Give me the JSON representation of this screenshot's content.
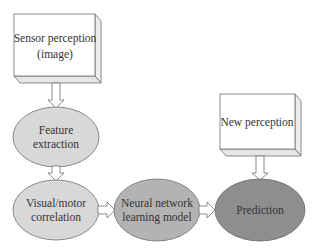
{
  "diagram": {
    "nodes": {
      "sensor": {
        "line1": "Sensor perception",
        "line2": "(image)",
        "shape": "3d-box"
      },
      "feature": {
        "line1": "Feature",
        "line2": "extraction",
        "shape": "ellipse",
        "fill": "#d8d8d8"
      },
      "visual": {
        "line1": "Visual/motor",
        "line2": "correlation",
        "shape": "ellipse",
        "fill": "#d8d8d8"
      },
      "neural": {
        "line1": "Neural network",
        "line2": "learning model",
        "shape": "ellipse",
        "fill": "#b3b3b3"
      },
      "prediction": {
        "line1": "Prediction",
        "shape": "ellipse",
        "fill": "#8e8e8e"
      },
      "newperception": {
        "line1": "New perception",
        "shape": "3d-box"
      }
    },
    "edges": [
      {
        "from": "sensor",
        "to": "feature"
      },
      {
        "from": "feature",
        "to": "visual"
      },
      {
        "from": "visual",
        "to": "neural"
      },
      {
        "from": "neural",
        "to": "prediction"
      },
      {
        "from": "newperception",
        "to": "prediction"
      }
    ],
    "colors": {
      "stroke": "#707070",
      "box_fill": "#ffffff",
      "box_side": "#f2f2f2",
      "text": "#333333"
    }
  }
}
